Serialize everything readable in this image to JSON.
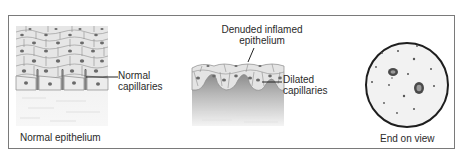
{
  "figure": {
    "panels": [
      {
        "id": "normal",
        "caption": "Normal epithelium",
        "annotations": [
          {
            "line1": "Normal",
            "line2": "capillaries"
          }
        ]
      },
      {
        "id": "inflamed",
        "caption": "",
        "annotations": [
          {
            "line1": "Denuded inflamed",
            "line2": "epithelium"
          },
          {
            "line1": "Dilated",
            "line2": "capillaries"
          }
        ]
      },
      {
        "id": "end-on",
        "caption": "End on view",
        "annotations": []
      }
    ],
    "colors": {
      "frame": "#7a7a7a",
      "cell_fill": "#e9e9e9",
      "cell_border": "#9a9a9a",
      "nucleus": "#6a6a6a",
      "stroma": "#f0f0f0",
      "inflamed_stroma_dark": "#8c8c8c",
      "circle_border": "#1e1e1e",
      "circle_fill": "#f2f2f2"
    }
  }
}
